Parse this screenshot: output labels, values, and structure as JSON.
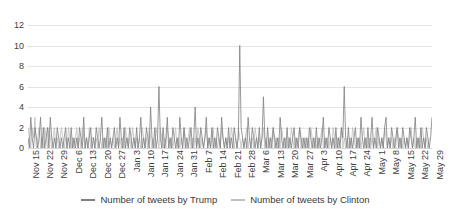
{
  "chart_data": {
    "type": "line",
    "title": "",
    "xlabel": "",
    "ylabel": "",
    "ylim": [
      0,
      12
    ],
    "yticks": [
      0,
      2,
      4,
      6,
      8,
      10,
      12
    ],
    "grid": true,
    "legend_position": "bottom",
    "x_tick_labels": [
      "Nov 15",
      "Nov 22",
      "Nov 29",
      "Dec 6",
      "Dec 13",
      "Dec 20",
      "Dec 27",
      "Jan 3",
      "Jan 10",
      "Jan 17",
      "Jan 24",
      "Jan 31",
      "Feb 7",
      "Feb 14",
      "Feb 21",
      "Feb 28",
      "Mar 6",
      "Mar 13",
      "Mar 20",
      "Mar 27",
      "Apr 3",
      "Apr 10",
      "Apr 17",
      "Apr 24",
      "May 1",
      "May 8",
      "May 15",
      "May 22",
      "May 29"
    ],
    "x_tick_interval_days": 7,
    "colors": {
      "trump": "#7f7f7f",
      "clinton": "#bfbfbf"
    },
    "series": [
      {
        "name": "Number of tweets by Trump",
        "color": "#7f7f7f",
        "values": [
          1,
          0,
          3,
          1,
          0,
          2,
          1,
          0,
          1,
          3,
          0,
          2,
          0,
          1,
          2,
          0,
          3,
          1,
          0,
          1,
          0,
          2,
          1,
          0,
          1,
          0,
          1,
          2,
          0,
          1,
          0,
          2,
          0,
          1,
          0,
          1,
          0,
          2,
          1,
          0,
          3,
          0,
          1,
          0,
          1,
          2,
          0,
          1,
          0,
          2,
          1,
          0,
          1,
          3,
          0,
          1,
          0,
          2,
          0,
          1,
          0,
          1,
          2,
          0,
          1,
          0,
          3,
          1,
          0,
          2,
          0,
          1,
          0,
          2,
          1,
          0,
          1,
          0,
          2,
          0,
          1,
          3,
          0,
          1,
          0,
          2,
          1,
          0,
          4,
          1,
          0,
          2,
          0,
          1,
          6,
          1,
          0,
          2,
          0,
          1,
          3,
          0,
          1,
          0,
          2,
          1,
          0,
          1,
          0,
          3,
          1,
          0,
          2,
          0,
          1,
          0,
          1,
          2,
          0,
          1,
          4,
          0,
          1,
          0,
          2,
          1,
          0,
          1,
          3,
          0,
          1,
          0,
          2,
          0,
          1,
          0,
          2,
          1,
          0,
          3,
          1,
          0,
          1,
          0,
          2,
          0,
          1,
          0,
          2,
          1,
          0,
          1,
          10,
          2,
          1,
          0,
          1,
          0,
          3,
          1,
          0,
          2,
          1,
          0,
          1,
          0,
          2,
          0,
          1,
          5,
          1,
          0,
          2,
          0,
          1,
          0,
          2,
          1,
          0,
          1,
          0,
          3,
          1,
          0,
          1,
          0,
          2,
          0,
          1,
          0,
          1,
          2,
          0,
          1,
          0,
          2,
          1,
          0,
          1,
          0,
          1,
          0,
          2,
          1,
          0,
          1,
          0,
          2,
          0,
          1,
          0,
          1,
          3,
          0,
          1,
          0,
          2,
          1,
          0,
          1,
          0,
          2,
          0,
          1,
          0,
          2,
          1,
          6,
          1,
          0,
          2,
          0,
          1,
          0,
          1,
          2,
          0,
          1,
          0,
          3,
          1,
          0,
          1,
          0,
          2,
          0,
          1,
          3,
          0,
          1,
          0,
          2,
          1,
          0,
          1,
          0,
          2,
          3,
          0,
          1,
          0,
          2,
          1,
          0,
          1,
          2,
          0,
          1,
          0,
          2,
          1,
          0,
          1,
          0,
          2,
          1,
          0,
          1,
          3,
          0,
          1,
          0,
          2,
          0,
          1,
          0,
          2,
          1,
          0,
          1,
          3
        ]
      },
      {
        "name": "Number of tweets by Clinton",
        "color": "#bfbfbf",
        "values": [
          2,
          1,
          0,
          2,
          1,
          3,
          0,
          1,
          2,
          0,
          1,
          0,
          2,
          1,
          0,
          2,
          1,
          0,
          1,
          2,
          0,
          1,
          0,
          1,
          2,
          1,
          0,
          1,
          0,
          2,
          1,
          0,
          1,
          0,
          1,
          2,
          0,
          1,
          0,
          2,
          1,
          0,
          1,
          0,
          2,
          0,
          1,
          1,
          0,
          1,
          0,
          2,
          1,
          0,
          1,
          0,
          1,
          0,
          2,
          1,
          0,
          1,
          0,
          1,
          2,
          0,
          1,
          0,
          1,
          0,
          2,
          1,
          0,
          1,
          0,
          2,
          1,
          0,
          1,
          0,
          1,
          0,
          2,
          1,
          0,
          1,
          0,
          2,
          1,
          0,
          1,
          0,
          2,
          1,
          0,
          2,
          1,
          0,
          1,
          0,
          2,
          1,
          0,
          1,
          0,
          1,
          2,
          0,
          1,
          0,
          1,
          0,
          2,
          1,
          0,
          1,
          2,
          0,
          1,
          0,
          1,
          0,
          2,
          1,
          0,
          1,
          0,
          1,
          2,
          0,
          1,
          0,
          1,
          2,
          0,
          1,
          0,
          1,
          0,
          2,
          1,
          0,
          1,
          0,
          1,
          0,
          2,
          1,
          0,
          1,
          0,
          2,
          1,
          0,
          1,
          0,
          1,
          2,
          0,
          1,
          0,
          1,
          0,
          2,
          1,
          0,
          1,
          0,
          1,
          2,
          0,
          1,
          0,
          1,
          0,
          1,
          2,
          0,
          1,
          0,
          1,
          0,
          2,
          1,
          0,
          1,
          0,
          1,
          0,
          2,
          1,
          0,
          1,
          0,
          1,
          2,
          0,
          1,
          0,
          1,
          0,
          1,
          0,
          2,
          1,
          0,
          1,
          0,
          1,
          0,
          1,
          2,
          0,
          1,
          0,
          1,
          0,
          1,
          0,
          2,
          1,
          0,
          1,
          0,
          1,
          2,
          0,
          1,
          0,
          1,
          0,
          1,
          0,
          2,
          1,
          0,
          1,
          0,
          1,
          0,
          1,
          2,
          0,
          1,
          0,
          1,
          0,
          1,
          0,
          1,
          2,
          0,
          1,
          0,
          1,
          0,
          2,
          1,
          0,
          1,
          0,
          1,
          0,
          1,
          0,
          2,
          1,
          0,
          1,
          0,
          1,
          0,
          1,
          0,
          1,
          2,
          0,
          1,
          0,
          1,
          0,
          1,
          0,
          2,
          1,
          0,
          1,
          0,
          1
        ]
      }
    ]
  },
  "legend": {
    "items": [
      {
        "label": "Number of tweets by Trump",
        "color": "#7f7f7f"
      },
      {
        "label": "Number of tweets by Clinton",
        "color": "#bfbfbf"
      }
    ]
  }
}
